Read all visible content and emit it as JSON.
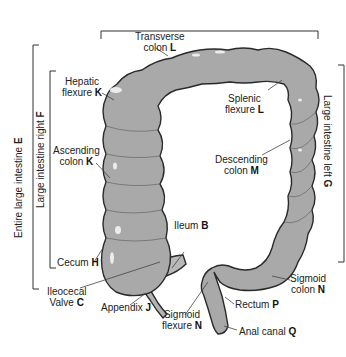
{
  "diagram": {
    "colors": {
      "colon_fill": "#a9a9a9",
      "colon_stroke": "#2a2a2a",
      "highlight": "#e8e8e8",
      "bracket": "#333333",
      "leader": "#444444",
      "text": "#222222",
      "background": "#ffffff"
    },
    "labels": {
      "transverse": {
        "line1": "Transverse",
        "line2": "colon",
        "letter": "L"
      },
      "hepatic": {
        "line1": "Hepatic",
        "line2": "flexure",
        "letter": "K"
      },
      "splenic": {
        "line1": "Splenic",
        "line2": "flexure",
        "letter": "L"
      },
      "ascending": {
        "line1": "Ascending",
        "line2": "colon",
        "letter": "K"
      },
      "descending": {
        "line1": "Descending",
        "line2": "colon",
        "letter": "M"
      },
      "ileum": {
        "text": "Ileum",
        "letter": "B"
      },
      "cecum": {
        "text": "Cecum",
        "letter": "H"
      },
      "ileocecal": {
        "line1": "Ileocecal",
        "line2": "Valve",
        "letter": "C"
      },
      "appendix": {
        "text": "Appendix",
        "letter": "J"
      },
      "sigmoid_flexure": {
        "line1": "Sigmoid",
        "line2": "flexure",
        "letter": "N"
      },
      "sigmoid_colon": {
        "line1": "Sigmoid",
        "line2": "colon",
        "letter": "N"
      },
      "rectum": {
        "text": "Rectum",
        "letter": "P"
      },
      "anal_canal": {
        "text": "Anal canal",
        "letter": "Q"
      },
      "entire_large_intestine": {
        "text": "Entire large intestine",
        "letter": "E"
      },
      "large_intestine_right": {
        "text": "Large intestine right",
        "letter": "F"
      },
      "large_intestine_left": {
        "text": "Large intestine left",
        "letter": "G"
      }
    }
  }
}
